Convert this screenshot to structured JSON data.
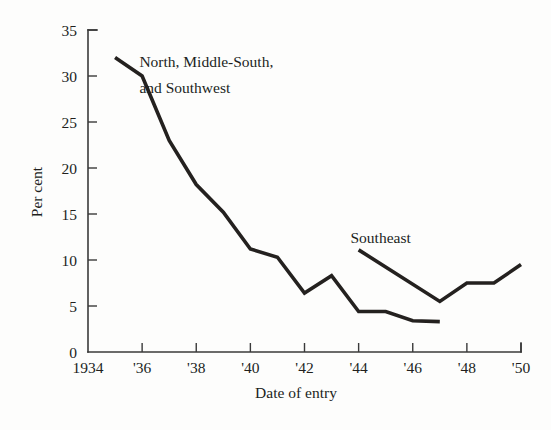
{
  "chart_data": {
    "type": "line",
    "title": "",
    "xlabel": "Date of entry",
    "ylabel": "Per cent",
    "xlim": [
      1934,
      1950
    ],
    "ylim": [
      0,
      35
    ],
    "grid": false,
    "legend_position": "inline-annotation",
    "yticks": [
      0,
      5,
      10,
      15,
      20,
      25,
      30,
      35
    ],
    "ytick_labels": [
      "0",
      "5",
      "10",
      "15",
      "20",
      "25",
      "30",
      "35"
    ],
    "xticks": [
      1934,
      1936,
      1938,
      1940,
      1942,
      1944,
      1946,
      1948,
      1950
    ],
    "xtick_labels": [
      "1934",
      "'36",
      "'38",
      "'40",
      "'42",
      "'44",
      "'46",
      "'48",
      "'50"
    ],
    "series": [
      {
        "name": "North, Middle-South, and Southwest",
        "label_lines": [
          "North, Middle-South,",
          "and Southwest"
        ],
        "color": "#24211f",
        "x": [
          1935,
          1936,
          1937,
          1938,
          1939,
          1940,
          1941,
          1942,
          1943,
          1944,
          1945,
          1946,
          1947
        ],
        "values": [
          32.0,
          30.0,
          23.0,
          18.2,
          15.2,
          11.2,
          10.3,
          6.4,
          8.3,
          4.4,
          4.4,
          3.4,
          3.3
        ]
      },
      {
        "name": "Southeast",
        "label_lines": [
          "Southeast"
        ],
        "color": "#24211f",
        "x": [
          1944,
          1947,
          1948,
          1949,
          1950
        ],
        "values": [
          11.1,
          5.5,
          7.5,
          7.5,
          9.5
        ]
      }
    ],
    "annotations": [
      {
        "text": "North, Middle-South,",
        "x": 1935.9,
        "y": 31.0
      },
      {
        "text": "and Southwest",
        "x": 1935.9,
        "y": 28.2
      },
      {
        "text": "Southeast",
        "x": 1943.7,
        "y": 11.9
      }
    ]
  },
  "axis": {
    "y_title": "Per cent",
    "x_title": "Date of entry"
  }
}
